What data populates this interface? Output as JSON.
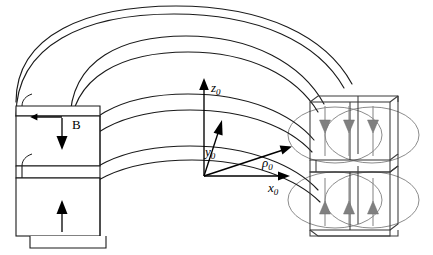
{
  "figure": {
    "background_color": "#ffffff",
    "width": 433,
    "height": 255
  },
  "colors": {
    "outline": "#1a1a1a",
    "outline_light": "#3a3a3a",
    "magnet_arrow": "#808080",
    "field_line": "#8c8c8c",
    "axis": "#000000",
    "label": "#000000"
  },
  "axes": {
    "origin": {
      "x": 204,
      "y": 176
    },
    "items": [
      {
        "name": "z-axis",
        "symbol": "z",
        "subscript": "0",
        "label": "z0",
        "direction": "up",
        "tip": {
          "x": 204,
          "y": 80
        },
        "label_pos": {
          "x": 212,
          "y": 90
        }
      },
      {
        "name": "y-axis",
        "symbol": "y",
        "subscript": "0",
        "label": "y0",
        "direction": "up-right-steep",
        "tip": {
          "x": 222,
          "y": 122
        },
        "label_pos": {
          "x": 207,
          "y": 152
        }
      },
      {
        "name": "x-axis",
        "symbol": "x",
        "subscript": "0",
        "label": "x0",
        "direction": "right",
        "tip": {
          "x": 288,
          "y": 176
        },
        "label_pos": {
          "x": 270,
          "y": 190
        }
      },
      {
        "name": "rho-vector",
        "symbol": "ρ",
        "subscript": "0",
        "label": "ρ0",
        "direction": "up-right-shallow",
        "tip": {
          "x": 290,
          "y": 146
        },
        "label_pos": {
          "x": 265,
          "y": 166
        }
      }
    ]
  },
  "left_face": {
    "name": "left-end-face",
    "magnetization_label": "B",
    "label_pos": {
      "x": 72,
      "y": 128
    },
    "upper_block": {
      "name": "upper-block",
      "arrow_direction": "down",
      "arrow": {
        "x": 62,
        "y": 117,
        "length": 32
      }
    },
    "lower_block": {
      "name": "lower-block",
      "arrow_direction": "up",
      "arrow": {
        "x": 62,
        "y": 228,
        "length": 32
      }
    }
  },
  "right_face": {
    "name": "right-end-face",
    "upper_block": {
      "name": "upper-magnet-block",
      "arrow_direction": "down",
      "arrow_count": 3,
      "arrow_xs": [
        325,
        349,
        373
      ],
      "arrow_top_y": 112,
      "arrow_bottom_y": 140
    },
    "lower_block": {
      "name": "lower-magnet-block",
      "arrow_direction": "up",
      "arrow_count": 3,
      "arrow_xs": [
        325,
        349,
        373
      ],
      "arrow_top_y": 192,
      "arrow_bottom_y": 222
    },
    "field_lines": {
      "name": "field-line-ellipses",
      "count": 4,
      "description": "Large gray ellipses around upper and lower magnet blocks"
    }
  },
  "arc_body": {
    "name": "curved-magnet-arc",
    "description": "Concentric curved bands forming a toroidal arc section",
    "band_count": 6
  }
}
